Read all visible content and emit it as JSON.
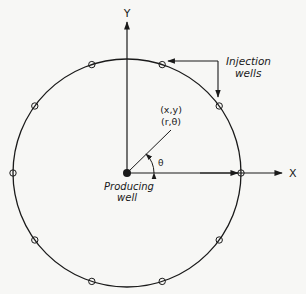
{
  "diagram": {
    "axes": {
      "x_label": "X",
      "y_label": "Y"
    },
    "point_label": {
      "cartesian": "(x,y)",
      "polar": "(r,θ)"
    },
    "angle_label": "θ",
    "producing_well": {
      "line1": "Producing",
      "line2": "well"
    },
    "injection_wells": {
      "line1": "Injection",
      "line2": "wells",
      "count": 10,
      "angles_deg": [
        0,
        36,
        72,
        108,
        144,
        180,
        216,
        252,
        288,
        324
      ]
    },
    "colors": {
      "ink": "#1a1a1a",
      "background": "#f7f7f5"
    }
  }
}
